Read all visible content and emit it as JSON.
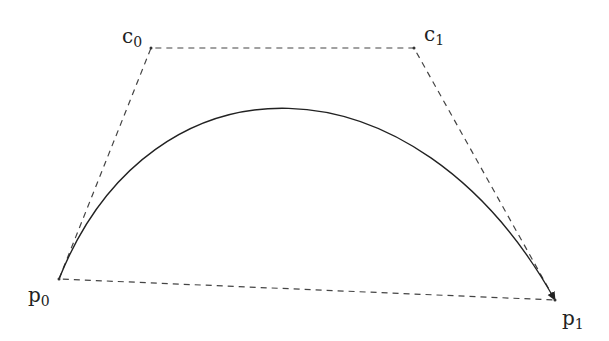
{
  "diagram": {
    "type": "cubic-bezier",
    "points": {
      "p0": {
        "label": "p",
        "sub": "0",
        "x": 59,
        "y": 279
      },
      "c0": {
        "label": "c",
        "sub": "0",
        "x": 151,
        "y": 48
      },
      "c1": {
        "label": "c",
        "sub": "1",
        "x": 414,
        "y": 48
      },
      "p1": {
        "label": "p",
        "sub": "1",
        "x": 555,
        "y": 300
      }
    },
    "colors": {
      "curve": "#222222",
      "dashed": "#444444"
    }
  }
}
